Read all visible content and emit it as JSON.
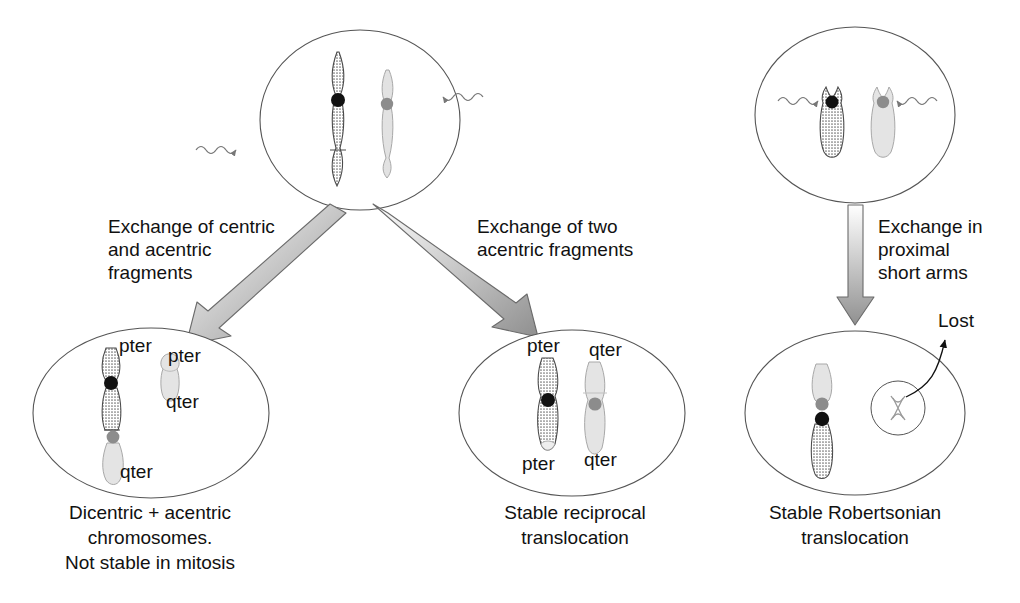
{
  "figure": {
    "domain": "diagram"
  },
  "colors": {
    "outline": "#555555",
    "dark_chromosome": "#8a8a8a",
    "light_chromosome": "#d8d8d8",
    "centromere_dark": "#111111",
    "centromere_gray": "#8c8c8c",
    "arrow_fill_start": "#ffffff",
    "arrow_fill_end": "#8f8f8f",
    "arrow_stroke": "#6b6b6b",
    "text": "#111111",
    "radiation_arrow": "#777777"
  },
  "panels": {
    "top_left": {
      "name": "parent-cell-metacentric",
      "chromosomes": [
        {
          "id": "chr-dark",
          "shade": "dark",
          "centromere": "black",
          "break_site": "long arm distal"
        },
        {
          "id": "chr-light",
          "shade": "light",
          "centromere": "gray",
          "break_site": "near centromere"
        }
      ],
      "radiation_hits": 2
    },
    "top_right": {
      "name": "parent-cell-acrocentric",
      "chromosomes": [
        {
          "id": "acro-dark",
          "shade": "dark",
          "centromere": "black",
          "break_site": "proximal short arm"
        },
        {
          "id": "acro-light",
          "shade": "light",
          "centromere": "gray",
          "break_site": "proximal short arm"
        }
      ],
      "radiation_hits": 2
    },
    "bottom_left": {
      "name": "dicentric-acentric-cell",
      "labels": [
        "pter",
        "pter",
        "qter",
        "qter"
      ],
      "caption_lines": [
        "Dicentric + acentric",
        "chromosomes.",
        "Not stable in mitosis"
      ]
    },
    "bottom_middle": {
      "name": "reciprocal-translocation-cell",
      "labels": [
        "pter",
        "qter",
        "pter",
        "qter"
      ],
      "caption_lines": [
        "Stable reciprocal",
        "translocation"
      ]
    },
    "bottom_right": {
      "name": "robertsonian-translocation-cell",
      "labels": [
        "Lost"
      ],
      "caption_lines": [
        "Stable Robertsonian",
        "translocation"
      ]
    }
  },
  "arrows": {
    "left": {
      "lines": [
        "Exchange of centric",
        "and acentric",
        "fragments"
      ]
    },
    "middle": {
      "lines": [
        "Exchange of two",
        "acentric fragments"
      ]
    },
    "right": {
      "lines": [
        "Exchange in",
        "proximal",
        "short arms"
      ]
    }
  },
  "annotations": {
    "pter": "pter",
    "qter": "qter",
    "lost": "Lost"
  },
  "captions": {
    "left_line1": "Dicentric + acentric",
    "left_line2": "chromosomes.",
    "left_line3": "Not stable in mitosis",
    "middle_line1": "Stable reciprocal",
    "middle_line2": "translocation",
    "right_line1": "Stable Robertsonian",
    "right_line2": "translocation"
  },
  "arrow_labels": {
    "left_line1": "Exchange of centric",
    "left_line2": "and acentric",
    "left_line3": "fragments",
    "middle_line1": "Exchange of two",
    "middle_line2": "acentric fragments",
    "right_line1": "Exchange in",
    "right_line2": "proximal",
    "right_line3": "short arms"
  },
  "bottom_left_labels": {
    "pter_dicentric": "pter",
    "pter_fragment": "pter",
    "qter_fragment": "qter",
    "qter_dicentric": "qter"
  },
  "bottom_middle_labels": {
    "pter_top": "pter",
    "qter_top": "qter",
    "pter_bottom": "pter",
    "qter_bottom": "qter"
  }
}
